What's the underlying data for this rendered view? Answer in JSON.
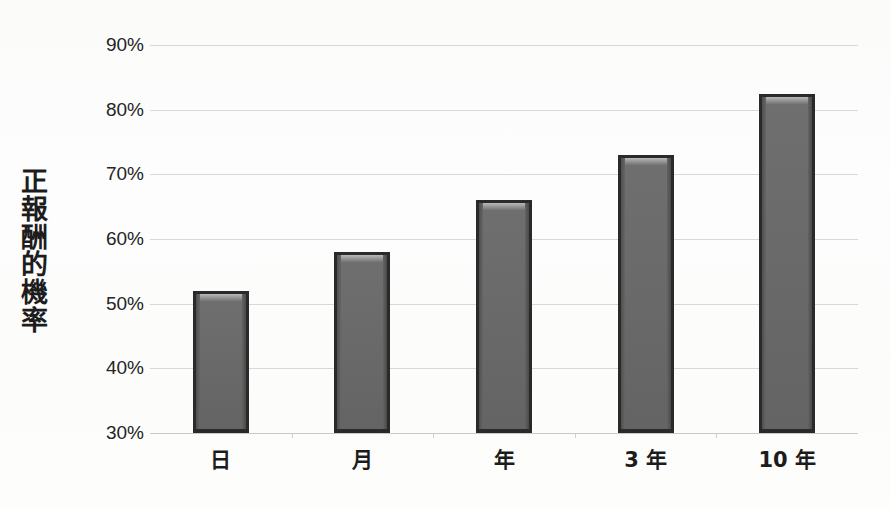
{
  "figure": {
    "title_remnant": "· · · · · · · · · ·",
    "background_color": "#fdfdfd",
    "bar_color": "#6a6a6a",
    "bar_edge_color": "#2a2a2a",
    "gridline_color": "#d8d8da",
    "text_color": "#1c1c1c"
  },
  "axes": {
    "y_axis_title": "正報酬的機率",
    "y_axis_title_chars": [
      "正",
      "報",
      "酬",
      "的",
      "機",
      "率"
    ],
    "y_tick_labels": [
      "90%",
      "80%",
      "70%",
      "60%",
      "50%",
      "40%",
      "30%"
    ],
    "y_tick_values": [
      90,
      80,
      70,
      60,
      50,
      40,
      30
    ],
    "x_tick_labels": [
      "日",
      "月",
      "年",
      "3 年",
      "10 年"
    ]
  },
  "chart_data": {
    "type": "bar",
    "title": "",
    "xlabel": "",
    "ylabel": "正報酬的機率",
    "categories": [
      "日",
      "月",
      "年",
      "3 年",
      "10 年"
    ],
    "values": [
      52,
      58,
      66,
      73,
      82.5
    ],
    "value_labels": [
      "52%",
      "58%",
      "66%",
      "73%",
      "82.5%"
    ],
    "ylim": [
      30,
      90
    ],
    "ytick_step": 10,
    "ytick_format": "percent",
    "grid": true,
    "grid_axis": "y",
    "legend": false,
    "legend_position": "none",
    "series": [
      {
        "name": "正報酬的機率",
        "values": [
          52,
          58,
          66,
          73,
          82.5
        ],
        "color": "#6a6a6a"
      }
    ]
  }
}
